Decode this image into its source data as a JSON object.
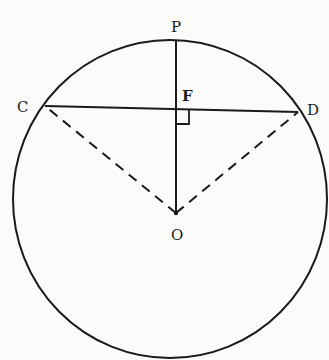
{
  "figure": {
    "colors": {
      "ink": "#1a1a1a",
      "background": "#fbfbfa"
    },
    "circle": {
      "cx": 170,
      "cy": 199,
      "rx": 157,
      "ry": 159
    },
    "points": {
      "P": {
        "label": "P",
        "x": 176,
        "y": 40
      },
      "F": {
        "label": "F",
        "x": 176,
        "y": 108
      },
      "C": {
        "label": "C",
        "x": 45,
        "y": 106
      },
      "D": {
        "label": "D",
        "x": 298,
        "y": 112
      },
      "O": {
        "label": "O",
        "x": 176,
        "y": 213
      }
    },
    "segments": [
      {
        "name": "chord-CD",
        "from": "C",
        "to": "D",
        "style": "solid"
      },
      {
        "name": "radius-OP",
        "from": "P",
        "to": "O",
        "style": "solid"
      },
      {
        "name": "radius-OC",
        "from": "O",
        "to": "C",
        "style": "dashed"
      },
      {
        "name": "radius-OD",
        "from": "O",
        "to": "D",
        "style": "dashed"
      }
    ],
    "right_angle_marker": {
      "at": "F",
      "size": 12
    }
  }
}
